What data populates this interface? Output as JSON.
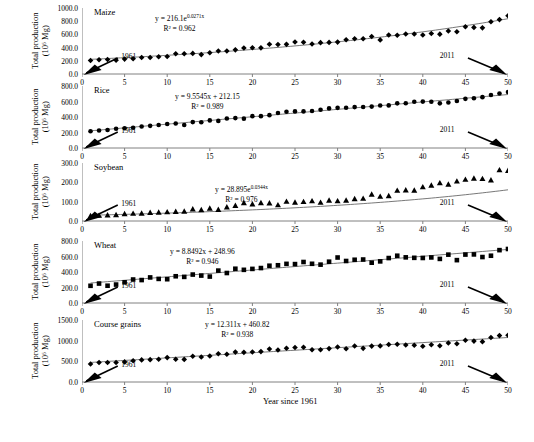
{
  "figure": {
    "axis_label_x": "Year since 1961",
    "axis_label_y_line1": "Total production",
    "axis_label_y_line2": "(10⁶ Mg)",
    "start_note": "1961",
    "end_note": "2011",
    "x_ticks": [
      "0",
      "5",
      "10",
      "15",
      "20",
      "25",
      "30",
      "35",
      "40",
      "45",
      "50"
    ],
    "marker_color": "#000000",
    "line_color": "#555555",
    "axis_color": "#808080"
  },
  "chart_data": [
    {
      "type": "scatter",
      "title": "Maize",
      "equation": "y = 216.1e",
      "equation_exp": "0.0271x",
      "r2": "R² = 0.962",
      "marker": "diamond",
      "xlabel": "Year since 1961",
      "ylabel": "Total production (10⁶ Mg)",
      "xlim": [
        0,
        50
      ],
      "ylim": [
        0,
        1000
      ],
      "y_ticks": [
        "0.0",
        "200.0",
        "400.0",
        "600.0",
        "800.0",
        "1000.0"
      ],
      "x": [
        1,
        2,
        3,
        4,
        5,
        6,
        7,
        8,
        9,
        10,
        11,
        12,
        13,
        14,
        15,
        16,
        17,
        18,
        19,
        20,
        21,
        22,
        23,
        24,
        25,
        26,
        27,
        28,
        29,
        30,
        31,
        32,
        33,
        34,
        35,
        36,
        37,
        38,
        39,
        40,
        41,
        42,
        43,
        44,
        45,
        46,
        47,
        48,
        49,
        50
      ],
      "values": [
        205,
        215,
        219,
        210,
        226,
        232,
        251,
        251,
        262,
        266,
        307,
        306,
        312,
        294,
        322,
        349,
        348,
        366,
        394,
        397,
        396,
        450,
        447,
        449,
        485,
        481,
        455,
        475,
        479,
        483,
        519,
        535,
        534,
        569,
        517,
        590,
        586,
        605,
        607,
        592,
        614,
        604,
        651,
        641,
        716,
        706,
        699,
        791,
        824,
        883
      ],
      "trend": {
        "type": "exponential",
        "a": 216.1,
        "b": 0.0271
      }
    },
    {
      "type": "scatter",
      "title": "Rice",
      "equation": "y = 9.5545x + 212.15",
      "equation_exp": "",
      "r2": "R² = 0.989",
      "marker": "circle",
      "xlabel": "Year since 1961",
      "ylabel": "Total production (10⁶ Mg)",
      "xlim": [
        0,
        50
      ],
      "ylim": [
        0,
        800
      ],
      "y_ticks": [
        "0.0",
        "200.0",
        "400.0",
        "600.0",
        "800.0"
      ],
      "x": [
        1,
        2,
        3,
        4,
        5,
        6,
        7,
        8,
        9,
        10,
        11,
        12,
        13,
        14,
        15,
        16,
        17,
        18,
        19,
        20,
        21,
        22,
        23,
        24,
        25,
        26,
        27,
        28,
        29,
        30,
        31,
        32,
        33,
        34,
        35,
        36,
        37,
        38,
        39,
        40,
        41,
        42,
        43,
        44,
        45,
        46,
        47,
        48,
        49,
        50
      ],
      "values": [
        216,
        226,
        233,
        249,
        255,
        261,
        277,
        286,
        296,
        309,
        316,
        297,
        334,
        333,
        356,
        350,
        380,
        386,
        379,
        411,
        411,
        424,
        451,
        468,
        472,
        472,
        478,
        493,
        511,
        518,
        519,
        528,
        529,
        534,
        548,
        550,
        576,
        578,
        596,
        599,
        597,
        576,
        587,
        607,
        634,
        642,
        656,
        684,
        703,
        722
      ],
      "trend": {
        "type": "linear",
        "slope": 9.5545,
        "intercept": 212.15
      }
    },
    {
      "type": "scatter",
      "title": "Soybean",
      "equation": "y = 28.895e",
      "equation_exp": "0.0344x",
      "r2": "R² = 0.976",
      "marker": "triangle",
      "xlabel": "Year since 1961",
      "ylabel": "Total production (10⁶ Mg)",
      "xlim": [
        0,
        50
      ],
      "ylim": [
        0,
        300
      ],
      "y_ticks": [
        "0.0",
        "100.0",
        "200.0",
        "300.0"
      ],
      "x": [
        1,
        2,
        3,
        4,
        5,
        6,
        7,
        8,
        9,
        10,
        11,
        12,
        13,
        14,
        15,
        16,
        17,
        18,
        19,
        20,
        21,
        22,
        23,
        24,
        25,
        26,
        27,
        28,
        29,
        30,
        31,
        32,
        33,
        34,
        35,
        36,
        37,
        38,
        39,
        40,
        41,
        42,
        43,
        44,
        45,
        46,
        47,
        48,
        49,
        50
      ],
      "values": [
        27,
        29,
        31,
        32,
        37,
        39,
        40,
        44,
        45,
        47,
        49,
        50,
        62,
        58,
        66,
        59,
        72,
        80,
        94,
        88,
        94,
        93,
        83,
        101,
        97,
        100,
        104,
        96,
        107,
        104,
        107,
        115,
        117,
        138,
        127,
        130,
        158,
        160,
        159,
        176,
        185,
        197,
        190,
        206,
        215,
        221,
        219,
        212,
        264,
        261
      ],
      "trend": {
        "type": "exponential",
        "a": 28.895,
        "b": 0.0344
      }
    },
    {
      "type": "scatter",
      "title": "Wheat",
      "equation": "y = 8.8492x + 248.96",
      "equation_exp": "",
      "r2": "R² = 0.946",
      "marker": "square",
      "xlabel": "Year since 1961",
      "ylabel": "Total production (10⁶ Mg)",
      "xlim": [
        0,
        50
      ],
      "ylim": [
        0,
        800
      ],
      "y_ticks": [
        "0.0",
        "200.0",
        "400.0",
        "600.0",
        "800.0"
      ],
      "x": [
        1,
        2,
        3,
        4,
        5,
        6,
        7,
        8,
        9,
        10,
        11,
        12,
        13,
        14,
        15,
        16,
        17,
        18,
        19,
        20,
        21,
        22,
        23,
        24,
        25,
        26,
        27,
        28,
        29,
        30,
        31,
        32,
        33,
        34,
        35,
        36,
        37,
        38,
        39,
        40,
        41,
        42,
        43,
        44,
        45,
        46,
        47,
        48,
        49,
        50
      ],
      "values": [
        222,
        251,
        223,
        238,
        267,
        303,
        296,
        330,
        311,
        307,
        345,
        337,
        367,
        354,
        341,
        418,
        387,
        442,
        428,
        440,
        451,
        481,
        487,
        505,
        502,
        529,
        506,
        495,
        533,
        587,
        542,
        558,
        561,
        520,
        537,
        580,
        610,
        589,
        583,
        581,
        588,
        569,
        624,
        553,
        625,
        627,
        593,
        610,
        682,
        697
      ],
      "trend": {
        "type": "linear",
        "slope": 8.8492,
        "intercept": 248.96
      }
    },
    {
      "type": "scatter",
      "title": "Course grains",
      "equation": "y = 12.311x + 460.82",
      "equation_exp": "",
      "r2": "R² = 0.938",
      "marker": "diamond",
      "xlabel": "Year since 1961",
      "ylabel": "Total production (10⁶ Mg)",
      "xlim": [
        0,
        50
      ],
      "ylim": [
        0,
        1500
      ],
      "y_ticks": [
        "0.0",
        "500.0",
        "1000.0",
        "1500.0"
      ],
      "x": [
        1,
        2,
        3,
        4,
        5,
        6,
        7,
        8,
        9,
        10,
        11,
        12,
        13,
        14,
        15,
        16,
        17,
        18,
        19,
        20,
        21,
        22,
        23,
        24,
        25,
        26,
        27,
        28,
        29,
        30,
        31,
        32,
        33,
        34,
        35,
        36,
        37,
        38,
        39,
        40,
        41,
        42,
        43,
        44,
        45,
        46,
        47,
        48,
        49,
        50
      ],
      "values": [
        437,
        470,
        472,
        470,
        486,
        513,
        535,
        541,
        549,
        590,
        551,
        547,
        624,
        605,
        630,
        685,
        672,
        723,
        717,
        724,
        735,
        800,
        775,
        815,
        836,
        840,
        782,
        781,
        808,
        846,
        806,
        870,
        814,
        869,
        873,
        906,
        912,
        894,
        889,
        866,
        900,
        876,
        943,
        926,
        1010,
        989,
        976,
        1078,
        1123,
        1130
      ],
      "trend": {
        "type": "linear",
        "slope": 12.311,
        "intercept": 460.82
      }
    }
  ]
}
